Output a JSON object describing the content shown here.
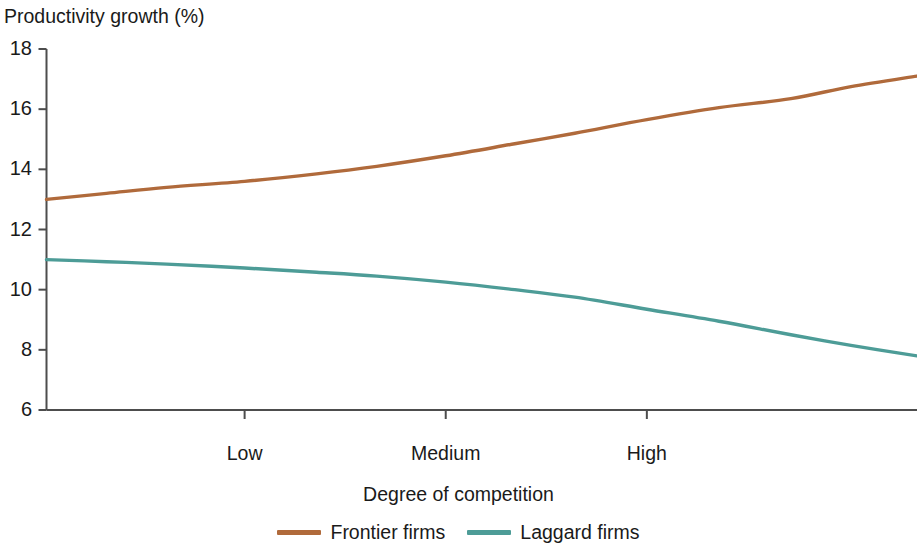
{
  "chart_data": {
    "type": "line",
    "title": "Productivity growth (%)",
    "xlabel": "Degree of competition",
    "ylabel": "Productivity growth (%)",
    "ylim": [
      6,
      18
    ],
    "ytick_labels": [
      "18",
      "16",
      "14",
      "12",
      "10",
      "8",
      "6"
    ],
    "ytick_values": [
      18,
      16,
      14,
      12,
      10,
      8,
      6
    ],
    "xtick_labels": [
      "Low",
      "Medium",
      "High"
    ],
    "xtick_values": [
      0.33,
      0.665,
      1.0
    ],
    "xlim": [
      0,
      1.45
    ],
    "grid": false,
    "legend_position": "bottom",
    "x": [
      0.0,
      0.1,
      0.2,
      0.33,
      0.45,
      0.55,
      0.665,
      0.78,
      0.88,
      1.0,
      1.12,
      1.24,
      1.34,
      1.45
    ],
    "series": [
      {
        "name": "Frontier firms",
        "color": "#b06a3b",
        "values": [
          13.0,
          13.2,
          13.4,
          13.6,
          13.85,
          14.1,
          14.45,
          14.85,
          15.2,
          15.65,
          16.05,
          16.35,
          16.75,
          17.1
        ]
      },
      {
        "name": "Laggard firms",
        "color": "#4d9c97",
        "values": [
          11.0,
          10.93,
          10.85,
          10.72,
          10.58,
          10.45,
          10.25,
          10.0,
          9.75,
          9.35,
          8.95,
          8.5,
          8.15,
          7.8
        ]
      }
    ]
  },
  "axes": {
    "y_title": "Productivity growth (%)",
    "x_title": "Degree of competition",
    "axis_color": "#4d4d4d"
  },
  "legend": {
    "items": [
      {
        "label": "Frontier firms",
        "color": "#b06a3b"
      },
      {
        "label": "Laggard firms",
        "color": "#4d9c97"
      }
    ]
  }
}
